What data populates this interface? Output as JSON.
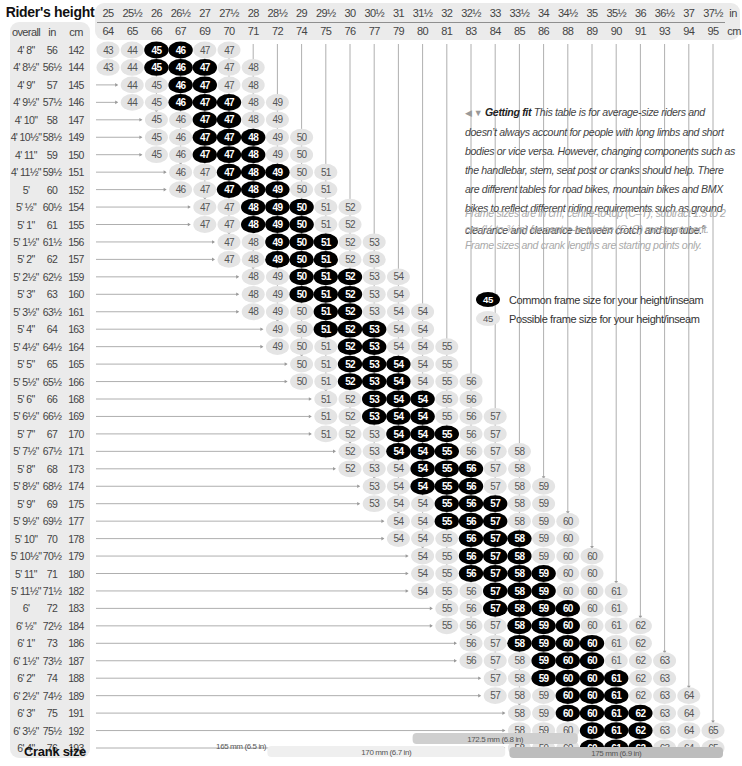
{
  "chart_data": {
    "type": "table",
    "title": "Rider's height",
    "xlabel": "Rider's inseam",
    "row_header": {
      "overall": "overall",
      "in": "in",
      "cm": "cm"
    },
    "columns_in": [
      "25",
      "25½",
      "26",
      "26½",
      "27",
      "27½",
      "28",
      "28½",
      "29",
      "29½",
      "30",
      "30½",
      "31",
      "31½",
      "32",
      "32½",
      "33",
      "33½",
      "34",
      "34½",
      "35",
      "35½",
      "36",
      "36½",
      "37",
      "37½"
    ],
    "columns_cm": [
      "64",
      "65",
      "66",
      "67",
      "69",
      "70",
      "71",
      "72",
      "74",
      "75",
      "76",
      "77",
      "79",
      "80",
      "81",
      "83",
      "84",
      "85",
      "86",
      "88",
      "89",
      "90",
      "91",
      "93",
      "94",
      "95"
    ],
    "unit_in": "in",
    "unit_cm": "cm",
    "rows": [
      {
        "overall": "4' 8\"",
        "in": "56",
        "cm": "142",
        "start": 0,
        "sizes": [
          43,
          44,
          45,
          46,
          47,
          47
        ],
        "common": [
          0,
          0,
          1,
          1,
          0,
          0
        ]
      },
      {
        "overall": "4' 8½\"",
        "in": "56½",
        "cm": "144",
        "start": 0,
        "sizes": [
          43,
          44,
          45,
          46,
          47,
          47,
          48
        ],
        "common": [
          0,
          0,
          1,
          1,
          1,
          0,
          0
        ]
      },
      {
        "overall": "4' 9\"",
        "in": "57",
        "cm": "145",
        "start": 1,
        "sizes": [
          44,
          45,
          46,
          47,
          47,
          48
        ],
        "common": [
          0,
          0,
          1,
          1,
          0,
          0
        ]
      },
      {
        "overall": "4' 9½\"",
        "in": "57½",
        "cm": "146",
        "start": 1,
        "sizes": [
          44,
          45,
          46,
          47,
          47,
          48,
          49
        ],
        "common": [
          0,
          0,
          1,
          1,
          1,
          0,
          0
        ]
      },
      {
        "overall": "4' 10\"",
        "in": "58",
        "cm": "147",
        "start": 2,
        "sizes": [
          45,
          46,
          47,
          47,
          48,
          49
        ],
        "common": [
          0,
          0,
          1,
          1,
          0,
          0
        ]
      },
      {
        "overall": "4' 10½\"",
        "in": "58½",
        "cm": "149",
        "start": 2,
        "sizes": [
          45,
          46,
          47,
          47,
          48,
          49,
          50
        ],
        "common": [
          0,
          0,
          1,
          1,
          1,
          0,
          0
        ]
      },
      {
        "overall": "4' 11\"",
        "in": "59",
        "cm": "150",
        "start": 2,
        "sizes": [
          45,
          46,
          47,
          47,
          48,
          49,
          50
        ],
        "common": [
          0,
          0,
          1,
          1,
          1,
          0,
          0
        ]
      },
      {
        "overall": "4' 11½\"",
        "in": "59½",
        "cm": "151",
        "start": 3,
        "sizes": [
          46,
          47,
          47,
          48,
          49,
          50,
          51
        ],
        "common": [
          0,
          0,
          1,
          1,
          1,
          0,
          0
        ]
      },
      {
        "overall": "5'",
        "in": "60",
        "cm": "152",
        "start": 3,
        "sizes": [
          46,
          47,
          47,
          48,
          49,
          50,
          51
        ],
        "common": [
          0,
          0,
          1,
          1,
          1,
          0,
          0
        ]
      },
      {
        "overall": "5' ½\"",
        "in": "60½",
        "cm": "154",
        "start": 4,
        "sizes": [
          47,
          47,
          48,
          49,
          50,
          51,
          52
        ],
        "common": [
          0,
          0,
          1,
          1,
          1,
          0,
          0
        ]
      },
      {
        "overall": "5' 1\"",
        "in": "61",
        "cm": "155",
        "start": 4,
        "sizes": [
          47,
          47,
          48,
          49,
          50,
          51,
          52
        ],
        "common": [
          0,
          0,
          1,
          1,
          1,
          0,
          0
        ]
      },
      {
        "overall": "5' 1½\"",
        "in": "61½",
        "cm": "156",
        "start": 5,
        "sizes": [
          47,
          48,
          49,
          50,
          51,
          52,
          53
        ],
        "common": [
          0,
          0,
          1,
          1,
          1,
          0,
          0
        ]
      },
      {
        "overall": "5' 2\"",
        "in": "62",
        "cm": "157",
        "start": 5,
        "sizes": [
          47,
          48,
          49,
          50,
          51,
          52,
          53
        ],
        "common": [
          0,
          0,
          1,
          1,
          1,
          0,
          0
        ]
      },
      {
        "overall": "5' 2½\"",
        "in": "62½",
        "cm": "159",
        "start": 6,
        "sizes": [
          48,
          49,
          50,
          51,
          52,
          53,
          54
        ],
        "common": [
          0,
          0,
          1,
          1,
          1,
          0,
          0
        ]
      },
      {
        "overall": "5' 3\"",
        "in": "63",
        "cm": "160",
        "start": 6,
        "sizes": [
          48,
          49,
          50,
          51,
          52,
          53,
          54
        ],
        "common": [
          0,
          0,
          1,
          1,
          1,
          0,
          0
        ]
      },
      {
        "overall": "5' 3½\"",
        "in": "63½",
        "cm": "161",
        "start": 6,
        "sizes": [
          48,
          49,
          50,
          51,
          52,
          53,
          54,
          54
        ],
        "common": [
          0,
          0,
          0,
          1,
          1,
          0,
          0,
          0
        ]
      },
      {
        "overall": "5' 4\"",
        "in": "64",
        "cm": "163",
        "start": 7,
        "sizes": [
          49,
          50,
          51,
          52,
          53,
          54,
          54
        ],
        "common": [
          0,
          0,
          1,
          1,
          1,
          0,
          0
        ]
      },
      {
        "overall": "5' 4½\"",
        "in": "64½",
        "cm": "164",
        "start": 7,
        "sizes": [
          49,
          50,
          51,
          52,
          53,
          54,
          54,
          55
        ],
        "common": [
          0,
          0,
          0,
          1,
          1,
          0,
          0,
          0
        ]
      },
      {
        "overall": "5' 5\"",
        "in": "65",
        "cm": "165",
        "start": 8,
        "sizes": [
          50,
          51,
          52,
          53,
          54,
          54,
          55
        ],
        "common": [
          0,
          0,
          1,
          1,
          1,
          0,
          0
        ]
      },
      {
        "overall": "5' 5½\"",
        "in": "65½",
        "cm": "166",
        "start": 8,
        "sizes": [
          50,
          51,
          52,
          53,
          54,
          54,
          55,
          56
        ],
        "common": [
          0,
          0,
          1,
          1,
          1,
          0,
          0,
          0
        ]
      },
      {
        "overall": "5' 6\"",
        "in": "66",
        "cm": "168",
        "start": 9,
        "sizes": [
          51,
          52,
          53,
          54,
          54,
          55,
          56
        ],
        "common": [
          0,
          0,
          1,
          1,
          1,
          0,
          0
        ]
      },
      {
        "overall": "5' 6½\"",
        "in": "66½",
        "cm": "169",
        "start": 9,
        "sizes": [
          51,
          52,
          53,
          54,
          54,
          55,
          56,
          57
        ],
        "common": [
          0,
          0,
          1,
          1,
          1,
          0,
          0,
          0
        ]
      },
      {
        "overall": "5' 7\"",
        "in": "67",
        "cm": "170",
        "start": 9,
        "sizes": [
          51,
          52,
          53,
          54,
          54,
          55,
          56,
          57
        ],
        "common": [
          0,
          0,
          0,
          1,
          1,
          1,
          0,
          0
        ]
      },
      {
        "overall": "5' 7½\"",
        "in": "67½",
        "cm": "171",
        "start": 10,
        "sizes": [
          52,
          53,
          54,
          54,
          55,
          56,
          57,
          58
        ],
        "common": [
          0,
          0,
          1,
          1,
          1,
          0,
          0,
          0
        ]
      },
      {
        "overall": "5' 8\"",
        "in": "68",
        "cm": "173",
        "start": 10,
        "sizes": [
          52,
          53,
          54,
          54,
          55,
          56,
          57,
          58
        ],
        "common": [
          0,
          0,
          0,
          1,
          1,
          1,
          0,
          0
        ]
      },
      {
        "overall": "5' 8½\"",
        "in": "68½",
        "cm": "174",
        "start": 11,
        "sizes": [
          53,
          54,
          54,
          55,
          56,
          57,
          58,
          59
        ],
        "common": [
          0,
          0,
          1,
          1,
          1,
          0,
          0,
          0
        ]
      },
      {
        "overall": "5' 9\"",
        "in": "69",
        "cm": "175",
        "start": 11,
        "sizes": [
          53,
          54,
          54,
          55,
          56,
          57,
          58,
          59
        ],
        "common": [
          0,
          0,
          0,
          1,
          1,
          1,
          0,
          0
        ]
      },
      {
        "overall": "5' 9½\"",
        "in": "69½",
        "cm": "177",
        "start": 12,
        "sizes": [
          54,
          54,
          55,
          56,
          57,
          58,
          59,
          60
        ],
        "common": [
          0,
          0,
          1,
          1,
          1,
          0,
          0,
          0
        ]
      },
      {
        "overall": "5' 10\"",
        "in": "70",
        "cm": "178",
        "start": 12,
        "sizes": [
          54,
          54,
          55,
          56,
          57,
          58,
          59,
          60
        ],
        "common": [
          0,
          0,
          0,
          1,
          1,
          1,
          0,
          0
        ]
      },
      {
        "overall": "5' 10½\"",
        "in": "70½",
        "cm": "179",
        "start": 13,
        "sizes": [
          54,
          55,
          56,
          57,
          58,
          59,
          60,
          60
        ],
        "common": [
          0,
          0,
          1,
          1,
          1,
          0,
          0,
          0
        ]
      },
      {
        "overall": "5' 11\"",
        "in": "71",
        "cm": "180",
        "start": 13,
        "sizes": [
          54,
          55,
          56,
          57,
          58,
          59,
          60,
          60
        ],
        "common": [
          0,
          0,
          1,
          1,
          1,
          1,
          0,
          0
        ]
      },
      {
        "overall": "5' 11½\"",
        "in": "71½",
        "cm": "182",
        "start": 13,
        "sizes": [
          54,
          55,
          56,
          57,
          58,
          59,
          60,
          60,
          61
        ],
        "common": [
          0,
          0,
          0,
          1,
          1,
          1,
          0,
          0,
          0
        ]
      },
      {
        "overall": "6'",
        "in": "72",
        "cm": "183",
        "start": 14,
        "sizes": [
          55,
          56,
          57,
          58,
          59,
          60,
          60,
          61
        ],
        "common": [
          0,
          0,
          1,
          1,
          1,
          1,
          0,
          0
        ]
      },
      {
        "overall": "6' ½\"",
        "in": "72½",
        "cm": "184",
        "start": 14,
        "sizes": [
          55,
          56,
          57,
          58,
          59,
          60,
          60,
          61,
          62
        ],
        "common": [
          0,
          0,
          0,
          1,
          1,
          1,
          0,
          0,
          0
        ]
      },
      {
        "overall": "6' 1\"",
        "in": "73",
        "cm": "186",
        "start": 15,
        "sizes": [
          56,
          57,
          58,
          59,
          60,
          60,
          61,
          62
        ],
        "common": [
          0,
          0,
          1,
          1,
          1,
          1,
          0,
          0
        ]
      },
      {
        "overall": "6' 1½\"",
        "in": "73½",
        "cm": "187",
        "start": 15,
        "sizes": [
          56,
          57,
          58,
          59,
          60,
          60,
          61,
          62,
          63
        ],
        "common": [
          0,
          0,
          0,
          1,
          1,
          1,
          0,
          0,
          0
        ]
      },
      {
        "overall": "6' 2\"",
        "in": "74",
        "cm": "188",
        "start": 16,
        "sizes": [
          57,
          58,
          59,
          60,
          60,
          61,
          62,
          63
        ],
        "common": [
          0,
          0,
          1,
          1,
          1,
          1,
          0,
          0
        ]
      },
      {
        "overall": "6' 2½\"",
        "in": "74½",
        "cm": "189",
        "start": 16,
        "sizes": [
          57,
          58,
          59,
          60,
          60,
          61,
          62,
          63,
          64
        ],
        "common": [
          0,
          0,
          0,
          1,
          1,
          1,
          0,
          0,
          0
        ]
      },
      {
        "overall": "6' 3\"",
        "in": "75",
        "cm": "191",
        "start": 17,
        "sizes": [
          58,
          59,
          60,
          60,
          61,
          62,
          63,
          64
        ],
        "common": [
          0,
          0,
          1,
          1,
          1,
          1,
          0,
          0
        ]
      },
      {
        "overall": "6' 3½\"",
        "in": "75½",
        "cm": "192",
        "start": 17,
        "sizes": [
          58,
          59,
          60,
          60,
          61,
          62,
          63,
          64,
          65
        ],
        "common": [
          0,
          0,
          0,
          1,
          1,
          1,
          0,
          0,
          0
        ]
      },
      {
        "overall": "6' 4\"",
        "in": "76",
        "cm": "193",
        "start": 17,
        "sizes": [
          58,
          59,
          60,
          60,
          61,
          62,
          63,
          64,
          65
        ],
        "common": [
          0,
          0,
          0,
          1,
          1,
          1,
          0,
          0,
          0
        ]
      }
    ],
    "crank": {
      "label": "Crank size",
      "bands": [
        {
          "label": "165 mm (6.5 in)",
          "from_col": 3,
          "to_col": 8,
          "shade": "none"
        },
        {
          "label": "170 mm (6.7 in)",
          "from_col": 7,
          "to_col": 16,
          "shade": "light"
        },
        {
          "label": "172.5 mm (6.8 in)",
          "from_col": 13,
          "to_col": 19,
          "shade": "mid"
        },
        {
          "label": "175 mm (6.9 in)",
          "from_col": 17,
          "to_col": 25,
          "shade": "dark"
        }
      ]
    },
    "legend": [
      {
        "sample": "45",
        "type": "common",
        "label": "Common frame size for your height/inseam"
      },
      {
        "sample": "45",
        "type": "possible",
        "label": "Possible frame size for your height/inseam"
      }
    ],
    "colors": {
      "common": "#000000",
      "possible": "#e4e4e4",
      "panel": "#ebebeb",
      "line": "#9a9a9a"
    }
  },
  "info": {
    "heading": "Getting fit",
    "pointer": "◀ ▼",
    "body": "This table is for average-size riders and doesn’t always account for people with long limbs and short bodies or vice versa. However, changing components such as the handlebar, stem, seat post or cranks should help. There are different tables for road bikes, mountain bikes and BMX bikes to reflect different riding requirements such as ground clearance and clearance between crotch and top tube.",
    "footnote": "6",
    "note": "Frame sizes are in cm, centre-to-top (C–T); subtract 1.5 to 2 cm (½ to ¾ in) for centre-to-centre (C–C) measurement. Frame sizes and crank lengths are starting points only."
  }
}
